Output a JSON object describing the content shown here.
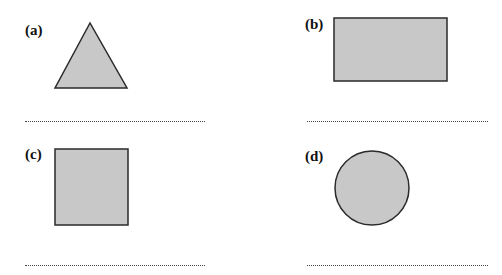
{
  "panels": [
    {
      "label": "(a)",
      "shape": "triangle",
      "answer": ""
    },
    {
      "label": "(b)",
      "shape": "rectangle",
      "answer": ""
    },
    {
      "label": "(c)",
      "shape": "square",
      "answer": ""
    },
    {
      "label": "(d)",
      "shape": "circle",
      "answer": ""
    }
  ],
  "colors": {
    "fill": "#c8c8c8",
    "stroke": "#2a2a2a"
  }
}
